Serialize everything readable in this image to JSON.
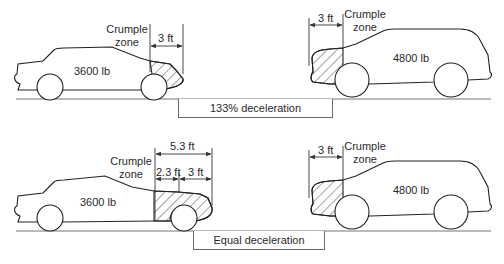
{
  "figure": {
    "panels": [
      {
        "id": "top",
        "car": {
          "weight_label": "3600 lb",
          "crumple_label": "Crumple\nzone",
          "crumple_line1": "Crumple",
          "crumple_line2": "zone",
          "crumple_length": "3 ft"
        },
        "suv": {
          "weight_label": "4800 lb",
          "crumple_line1": "Crumple",
          "crumple_line2": "zone",
          "crumple_length": "3 ft"
        },
        "result_label": "133% deceleration"
      },
      {
        "id": "bottom",
        "car": {
          "weight_label": "3600 lb",
          "crumple_line1": "Crumple",
          "crumple_line2": "zone",
          "total_length": "5.3 ft",
          "extra_length": "2.3 ft",
          "base_length": "3 ft"
        },
        "suv": {
          "weight_label": "4800 lb",
          "crumple_line1": "Crumple",
          "crumple_line2": "zone",
          "crumple_length": "3 ft"
        },
        "result_label": "Equal deceleration"
      }
    ]
  }
}
